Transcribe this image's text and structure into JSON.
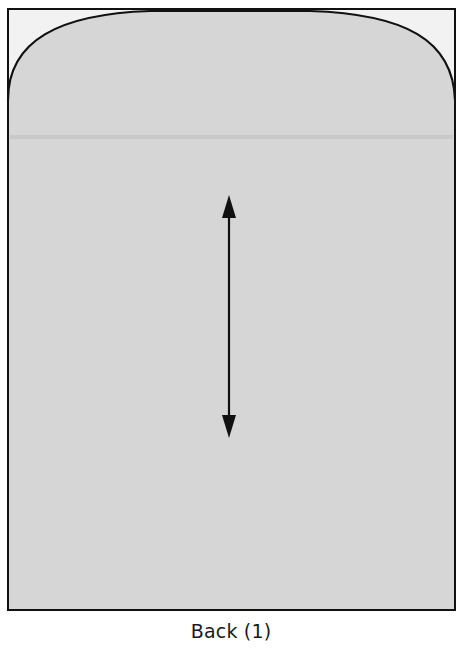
{
  "diagram": {
    "title": "Back (1)",
    "piece_name": "Back",
    "cut_quantity": 1,
    "colors": {
      "background": "#ffffff",
      "pattern_fill": "#d6d6d6",
      "bounding_box_fill": "#f2f2f2",
      "outline": "#111111",
      "fold_line": "#c4c4c4"
    },
    "elements": [
      {
        "name": "bounding-rectangle",
        "description": "Outer rectangle enclosing the pattern piece"
      },
      {
        "name": "pattern-piece",
        "description": "Gray back panel with curved rounded top corners"
      },
      {
        "name": "fold-line",
        "description": "Faint horizontal crease across the upper part"
      },
      {
        "name": "grainline-arrow",
        "description": "Vertical double-headed grainline arrow"
      }
    ]
  }
}
